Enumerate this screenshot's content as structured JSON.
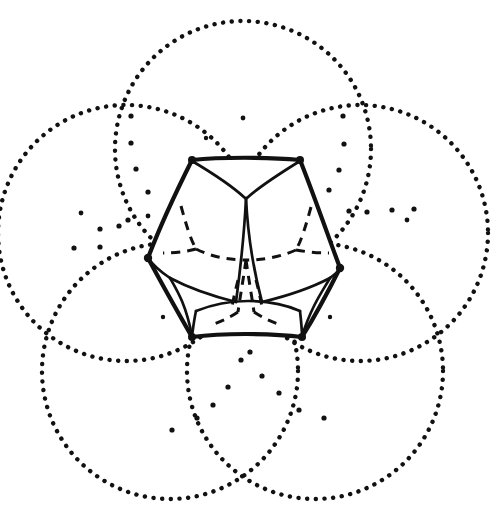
{
  "figure": {
    "title": "Dodecahedron inscribed in a rosette of five dotted circles",
    "background_color": "#ffffff",
    "ink_color": "#111111",
    "width": 493,
    "height": 513,
    "style": "hand-drawn line illustration, black ink on white"
  },
  "chart_data": {
    "type": "diagram",
    "title": "Dodecahedron inscribed in a rosette of five dotted circles",
    "subtitle": "",
    "xlabel": "",
    "ylabel": "",
    "grid": false,
    "legend": null,
    "annotations": [],
    "elements": {
      "dotted_circles": {
        "count": 5,
        "arrangement": "five-fold rosette about the central solid",
        "stroke": "dotted",
        "radius": 128,
        "centers": [
          {
            "id": "circle-top",
            "cx": 243,
            "cy": 149,
            "r": 128
          },
          {
            "id": "circle-upper-right",
            "cx": 360,
            "cy": 233,
            "r": 128
          },
          {
            "id": "circle-lower-right",
            "cx": 315,
            "cy": 371,
            "r": 128
          },
          {
            "id": "circle-lower-left",
            "cx": 170,
            "cy": 371,
            "r": 128
          },
          {
            "id": "circle-upper-left",
            "cx": 126,
            "cy": 233,
            "r": 128
          }
        ]
      },
      "polyhedron": {
        "name": "dodecahedron",
        "faces_visible": 6,
        "edge_style_visible": "solid",
        "edge_style_hidden": "dashed",
        "center": {
          "x": 246,
          "y": 250
        },
        "outline_vertices": [
          {
            "x": 192,
            "y": 160
          },
          {
            "x": 300,
            "y": 160
          },
          {
            "x": 340,
            "y": 268
          },
          {
            "x": 302,
            "y": 336
          },
          {
            "x": 192,
            "y": 336
          },
          {
            "x": 148,
            "y": 258
          }
        ],
        "silhouette_extent": {
          "left": 148,
          "right": 340,
          "top": 158,
          "bottom": 338
        }
      },
      "stipple_dots": {
        "description": "loose scatter of ink dots inside each circle",
        "count": 44
      }
    }
  }
}
